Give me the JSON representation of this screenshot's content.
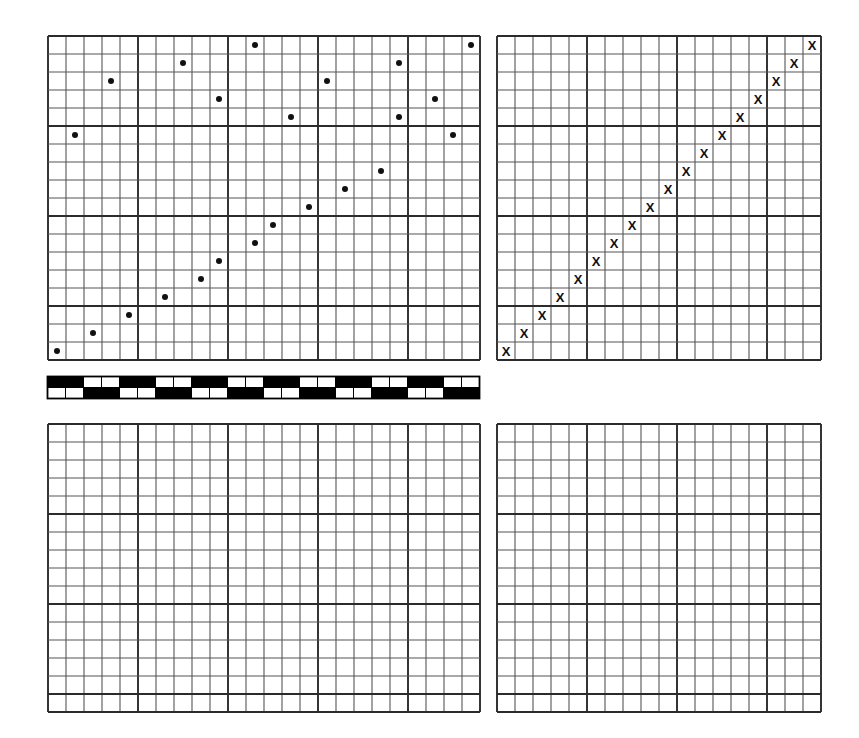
{
  "figure": {
    "background_color": "#ffffff",
    "grid_line_color": "#555555",
    "grid_major_color": "#2b2b2b",
    "marker_color": "#111111",
    "panel_count": 4
  },
  "chart_data": [
    {
      "id": "panel-top-left",
      "type": "scatter",
      "title": "",
      "xlabel": "",
      "ylabel": "",
      "grid": true,
      "grid_cell_px": 18,
      "grid_major_every": 5,
      "cols": 24,
      "rows": 18,
      "xlim": [
        0,
        24
      ],
      "ylim": [
        0,
        18
      ],
      "marker": "circle",
      "marker_size_px": 6,
      "points": [
        {
          "x": 0,
          "y": 0
        },
        {
          "x": 2,
          "y": 1
        },
        {
          "x": 4,
          "y": 2
        },
        {
          "x": 6,
          "y": 3
        },
        {
          "x": 8,
          "y": 4
        },
        {
          "x": 9,
          "y": 5
        },
        {
          "x": 11,
          "y": 6
        },
        {
          "x": 12,
          "y": 7
        },
        {
          "x": 14,
          "y": 8
        },
        {
          "x": 16,
          "y": 9
        },
        {
          "x": 18,
          "y": 10
        },
        {
          "x": 1,
          "y": 12
        },
        {
          "x": 22,
          "y": 12
        },
        {
          "x": 13,
          "y": 13
        },
        {
          "x": 19,
          "y": 13
        },
        {
          "x": 21,
          "y": 14
        },
        {
          "x": 9,
          "y": 14
        },
        {
          "x": 3,
          "y": 15
        },
        {
          "x": 15,
          "y": 15
        },
        {
          "x": 7,
          "y": 16
        },
        {
          "x": 19,
          "y": 16
        },
        {
          "x": 11,
          "y": 17
        },
        {
          "x": 23,
          "y": 17
        }
      ]
    },
    {
      "id": "panel-top-right",
      "type": "scatter",
      "title": "",
      "xlabel": "",
      "ylabel": "",
      "grid": true,
      "grid_cell_px": 18,
      "grid_major_every": 5,
      "cols": 18,
      "rows": 18,
      "xlim": [
        0,
        18
      ],
      "ylim": [
        0,
        18
      ],
      "marker": "x",
      "marker_size_px": 13,
      "points": [
        {
          "x": 0,
          "y": 0
        },
        {
          "x": 1,
          "y": 1
        },
        {
          "x": 2,
          "y": 2
        },
        {
          "x": 3,
          "y": 3
        },
        {
          "x": 4,
          "y": 4
        },
        {
          "x": 5,
          "y": 5
        },
        {
          "x": 6,
          "y": 6
        },
        {
          "x": 7,
          "y": 7
        },
        {
          "x": 8,
          "y": 8
        },
        {
          "x": 9,
          "y": 9
        },
        {
          "x": 10,
          "y": 10
        },
        {
          "x": 11,
          "y": 11
        },
        {
          "x": 12,
          "y": 12
        },
        {
          "x": 13,
          "y": 13
        },
        {
          "x": 14,
          "y": 14
        },
        {
          "x": 15,
          "y": 15
        },
        {
          "x": 16,
          "y": 16
        },
        {
          "x": 17,
          "y": 17
        }
      ]
    },
    {
      "id": "panel-bottom-left",
      "type": "scatter",
      "title": "",
      "xlabel": "",
      "ylabel": "",
      "grid": true,
      "grid_cell_px": 18,
      "grid_major_every": 5,
      "cols": 24,
      "rows": 16,
      "xlim": [
        0,
        24
      ],
      "ylim": [
        0,
        16
      ],
      "marker": "circle",
      "marker_size_px": 6,
      "points": []
    },
    {
      "id": "panel-bottom-right",
      "type": "scatter",
      "title": "",
      "xlabel": "",
      "ylabel": "",
      "grid": true,
      "grid_cell_px": 18,
      "grid_major_every": 5,
      "cols": 18,
      "rows": 16,
      "xlim": [
        0,
        18
      ],
      "ylim": [
        0,
        16
      ],
      "marker": "x",
      "marker_size_px": 13,
      "points": []
    }
  ],
  "checker_strip": {
    "id": "checker-strip",
    "type": "heatmap",
    "description": "two-row alternating black and white checkerboard bar",
    "cell_w_px": 18,
    "cell_h_px": 11,
    "cols": 24,
    "rows": 2,
    "block_len": 2,
    "colors": {
      "on": "#000000",
      "off": "#ffffff"
    },
    "top_row_starts_on": true
  }
}
